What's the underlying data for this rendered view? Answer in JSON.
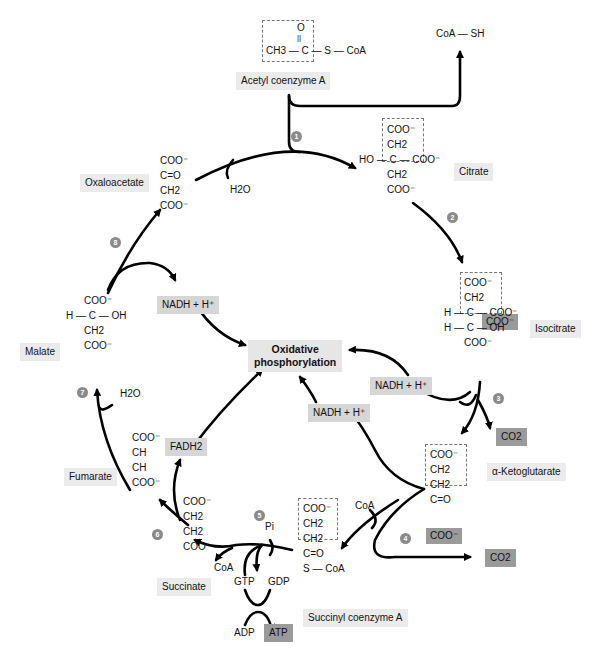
{
  "diagram": {
    "type": "metabolic-cycle",
    "center": {
      "label_line1": "Oxidative",
      "label_line2": "phosphorylation"
    },
    "inputs": {
      "acetyl_coa": {
        "name": "Acetyl coenzyme A",
        "structure": {
          "top": "O",
          "double_bond": "||",
          "main": "CH3 — C — S — CoA"
        }
      },
      "coa_sh": "CoA — SH"
    },
    "intermediates": [
      {
        "id": "oxaloacetate",
        "name": "Oxaloacetate",
        "structure": [
          "COO⁻",
          "C=O",
          "CH2",
          "COO⁻"
        ]
      },
      {
        "id": "citrate",
        "name": "Citrate",
        "structure": [
          "COO⁻",
          "CH2",
          "HO — C — COO⁻",
          "CH2",
          "COO⁻"
        ]
      },
      {
        "id": "isocitrate",
        "name": "Isocitrate",
        "structure": [
          "COO⁻",
          "CH2",
          "H — C — COO⁻",
          "H — C — OH",
          "COO⁻"
        ]
      },
      {
        "id": "alpha_ketoglutarate",
        "name": "α-Ketoglutarate",
        "structure": [
          "COO⁻",
          "CH2",
          "CH2",
          "C=O",
          "COO⁻"
        ]
      },
      {
        "id": "succinyl_coa",
        "name": "Succinyl coenzyme A",
        "structure": [
          "COO⁻",
          "CH2",
          "CH2",
          "C=O",
          "S — CoA"
        ]
      },
      {
        "id": "succinate",
        "name": "Succinate",
        "structure": [
          "COO⁻",
          "CH2",
          "CH2",
          "COO⁻"
        ]
      },
      {
        "id": "fumarate",
        "name": "Fumarate",
        "structure": [
          "COO⁻",
          "CH",
          "CH",
          "COO⁻"
        ]
      },
      {
        "id": "malate",
        "name": "Malate",
        "structure": [
          "COO⁻",
          "H — C — OH",
          "CH2",
          "COO⁻"
        ]
      }
    ],
    "steps": [
      "1",
      "2",
      "3",
      "4",
      "5",
      "6",
      "7",
      "8"
    ],
    "cofactors": {
      "h2o_step1": "H2O",
      "h2o_step7": "H2O",
      "nadh_step3": "NADH + H⁺",
      "nadh_step4": "NADH + H⁺",
      "nadh_step8": "NADH + H⁺",
      "fadh2": "FADH2",
      "co2_step3": "CO2",
      "co2_step4": "CO2",
      "coa_step4": "CoA",
      "coa_step5": "CoA",
      "pi": "Pi",
      "gtp": "GTP",
      "gdp": "GDP",
      "adp": "ADP",
      "atp": "ATP"
    },
    "colors": {
      "light_label": "#ebebeb",
      "highlight": "#9a9a9a",
      "step_circle": "#8a8a8a",
      "arrow": "#000000"
    }
  }
}
